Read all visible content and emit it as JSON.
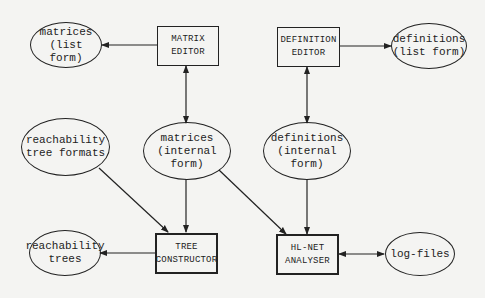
{
  "diagram": {
    "nodes": {
      "matrices_list": {
        "line1": "matrices",
        "line2": "(list form)"
      },
      "matrix_editor": {
        "line1": "MATRIX",
        "line2": "EDITOR"
      },
      "definition_editor": {
        "line1": "DEFINITION",
        "line2": "EDITOR"
      },
      "definitions_list": {
        "line1": "definitions",
        "line2": "(list form)"
      },
      "reach_formats": {
        "line1": "reachability",
        "line2": "tree formats"
      },
      "matrices_internal": {
        "line1": "matrices",
        "line2": "(internal form)"
      },
      "definitions_internal": {
        "line1": "definitions",
        "line2": "(internal form)"
      },
      "reach_trees": {
        "line1": "reachability",
        "line2": "trees"
      },
      "tree_constructor": {
        "line1": "TREE",
        "line2": "CONSTRUCTOR"
      },
      "hlnet_analyser": {
        "line1": "HL-NET",
        "line2": "ANALYSER"
      },
      "log_files": {
        "line1": "log-files"
      }
    },
    "edges": [
      {
        "from": "MATRIX EDITOR",
        "to": "matrices (list form)",
        "type": "directed"
      },
      {
        "from": "MATRIX EDITOR",
        "to": "matrices (internal form)",
        "type": "bidirectional"
      },
      {
        "from": "DEFINITION EDITOR",
        "to": "definitions (list form)",
        "type": "directed"
      },
      {
        "from": "DEFINITION EDITOR",
        "to": "definitions (internal form)",
        "type": "bidirectional"
      },
      {
        "from": "reachability tree formats",
        "to": "TREE CONSTRUCTOR",
        "type": "directed"
      },
      {
        "from": "matrices (internal form)",
        "to": "TREE CONSTRUCTOR",
        "type": "directed"
      },
      {
        "from": "matrices (internal form)",
        "to": "HL-NET ANALYSER",
        "type": "directed"
      },
      {
        "from": "definitions (internal form)",
        "to": "HL-NET ANALYSER",
        "type": "directed"
      },
      {
        "from": "TREE CONSTRUCTOR",
        "to": "reachability trees",
        "type": "directed"
      },
      {
        "from": "HL-NET ANALYSER",
        "to": "log-files",
        "type": "bidirectional"
      }
    ]
  }
}
